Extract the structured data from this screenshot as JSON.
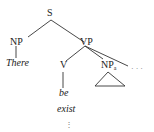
{
  "tree": {
    "root": "S",
    "nodes": {
      "s": "S",
      "np": "NP",
      "vp": "VP",
      "v": "V",
      "np_a": "NP",
      "np_a_sub": "a",
      "ellipsis": "· · ·"
    },
    "leaves": {
      "there": "There",
      "be": "be",
      "exist": "exist",
      "continuation": "⋮"
    },
    "edges": [
      [
        "S",
        "NP"
      ],
      [
        "S",
        "VP"
      ],
      [
        "NP",
        "There"
      ],
      [
        "VP",
        "V"
      ],
      [
        "VP",
        "NP_a"
      ],
      [
        "VP",
        "..."
      ],
      [
        "V",
        "be"
      ]
    ]
  }
}
